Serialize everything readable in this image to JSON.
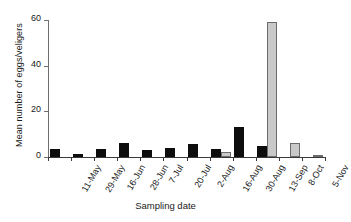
{
  "chart_data": {
    "type": "bar",
    "title": "",
    "xlabel": "Sampling date",
    "ylabel": "Mean number of eggs/veligers",
    "categories": [
      "11-May",
      "29-May",
      "16-Jun",
      "28-Jun",
      "7-Jul",
      "20-Jul",
      "2-Aug",
      "16-Aug",
      "30-Aug",
      "13-Sep",
      "8-Oct",
      "5-Nov"
    ],
    "ylim": [
      0,
      60
    ],
    "yticks": [
      0,
      20,
      40,
      60
    ],
    "ytick_labels": [
      "0",
      "20",
      "40",
      "60"
    ],
    "grid": false,
    "legend": "none",
    "series": [
      {
        "name": "eggs",
        "color": "#0d0d0d",
        "values": [
          3.5,
          1.5,
          3.5,
          6.0,
          3.0,
          4.0,
          5.5,
          3.5,
          13.0,
          5.0,
          0.0,
          0.0
        ]
      },
      {
        "name": "veligers",
        "color": "#c9c9c9",
        "values": [
          0.0,
          0.0,
          0.0,
          0.0,
          0.0,
          0.0,
          0.0,
          2.0,
          0.0,
          59.0,
          6.0,
          0.3
        ]
      }
    ]
  },
  "axes": {
    "y_title": "Mean number of eggs/veligers",
    "x_title": "Sampling date"
  }
}
